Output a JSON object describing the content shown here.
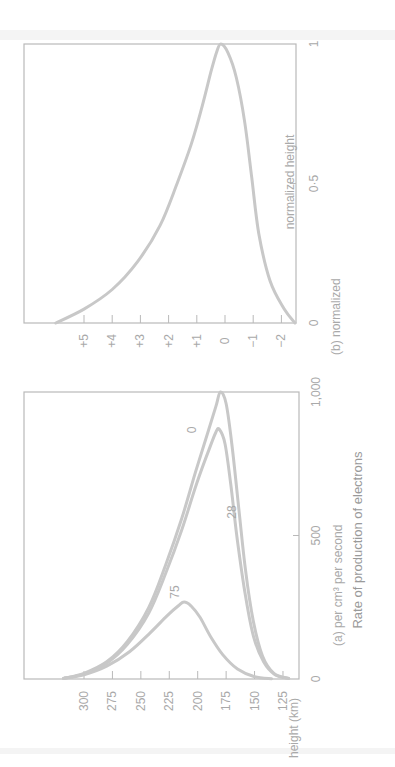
{
  "figure": {
    "overall_xlabel": "Rate of production of electrons",
    "panel_a": {
      "caption": "(a) per cm³ per second",
      "ylabel": "height (km)",
      "x_ticks": [
        "0",
        "500",
        "1,000"
      ],
      "y_ticks": [
        "300",
        "275",
        "250",
        "225",
        "200",
        "175",
        "150",
        "125"
      ],
      "curve_labels": [
        "0",
        "28",
        "75"
      ]
    },
    "panel_b": {
      "caption": "(b) normalized",
      "ylabel": "normalized height",
      "x_ticks": [
        "0",
        "0·5",
        "1"
      ],
      "y_ticks": [
        "+5",
        "+4",
        "+3",
        "+2",
        "+1",
        "0",
        "−1",
        "−2"
      ]
    }
  },
  "chart_data": [
    {
      "type": "line",
      "title": "(a) per cm³ per second",
      "xlabel": "Rate of production of electrons (per cm³ per second)",
      "ylabel": "height (km)",
      "xlim": [
        0,
        1000
      ],
      "ylim": [
        115,
        320
      ],
      "grid": false,
      "legend": "inline labels (solar zenith angle)",
      "series": [
        {
          "name": "0",
          "x": [
            2,
            20,
            60,
            130,
            250,
            400,
            560,
            720,
            860,
            950,
            1000,
            960,
            820,
            600,
            380,
            200,
            80,
            20,
            2
          ],
          "y": [
            318,
            300,
            280,
            262,
            243,
            228,
            214,
            202,
            191,
            184,
            180,
            175,
            170,
            164,
            158,
            151,
            143,
            133,
            120
          ]
        },
        {
          "name": "28",
          "x": [
            2,
            18,
            55,
            120,
            230,
            370,
            520,
            680,
            800,
            860,
            870,
            820,
            680,
            480,
            290,
            150,
            60,
            15,
            2
          ],
          "y": [
            318,
            300,
            280,
            262,
            243,
            228,
            214,
            201,
            190,
            184,
            181,
            176,
            171,
            165,
            158,
            151,
            142,
            132,
            120
          ]
        },
        {
          "name": "75",
          "x": [
            2,
            15,
            45,
            95,
            160,
            220,
            255,
            268,
            255,
            215,
            150,
            85,
            35,
            8,
            1
          ],
          "y": [
            318,
            300,
            280,
            260,
            242,
            227,
            217,
            212,
            206,
            198,
            189,
            178,
            165,
            150,
            135
          ]
        }
      ]
    },
    {
      "type": "line",
      "title": "(b) normalized",
      "xlabel": "Rate of production of electrons (normalized)",
      "ylabel": "normalized height",
      "xlim": [
        0,
        1
      ],
      "ylim": [
        -2.5,
        5.5
      ],
      "grid": false,
      "series": [
        {
          "name": "normalized",
          "x": [
            0.0,
            0.05,
            0.12,
            0.22,
            0.35,
            0.5,
            0.64,
            0.78,
            0.9,
            0.97,
            1.0,
            0.97,
            0.88,
            0.72,
            0.52,
            0.32,
            0.15,
            0.05,
            0.0
          ],
          "y": [
            6.0,
            5.0,
            4.0,
            3.1,
            2.3,
            1.7,
            1.2,
            0.8,
            0.5,
            0.3,
            0.15,
            -0.1,
            -0.4,
            -0.7,
            -0.95,
            -1.2,
            -1.6,
            -2.1,
            -2.5
          ]
        }
      ]
    }
  ]
}
